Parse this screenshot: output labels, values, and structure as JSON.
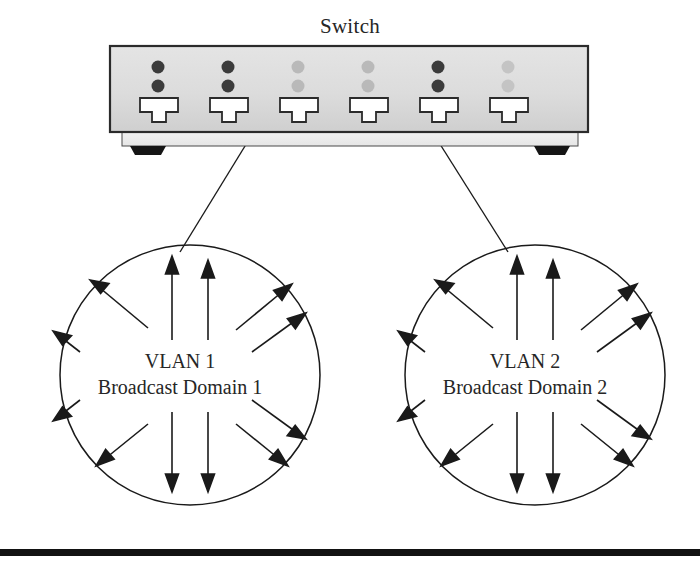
{
  "figure": {
    "title": "Switch",
    "background_color": "#ffffff",
    "line_color": "#1a1a1a"
  },
  "switch_device": {
    "name": "Switch",
    "label": "Switch",
    "body_color": "#dcdcdc",
    "body_shadow_color": "#c8c8c8",
    "base_color": "#efefef",
    "border_color": "#2b2b2b",
    "foot_color": "#151515",
    "port_count": 6,
    "port_label": "RJ45 port",
    "led_rows": 2,
    "led_active_color": "#3b3b3b",
    "led_inactive_color": "#b9b9b9",
    "ports": [
      {
        "index": 1,
        "led_top": "active",
        "led_bottom": "active"
      },
      {
        "index": 2,
        "led_top": "active",
        "led_bottom": "active"
      },
      {
        "index": 3,
        "led_top": "inactive",
        "led_bottom": "inactive"
      },
      {
        "index": 4,
        "led_top": "inactive",
        "led_bottom": "inactive"
      },
      {
        "index": 5,
        "led_top": "active",
        "led_bottom": "active"
      },
      {
        "index": 6,
        "led_top": "inactive",
        "led_bottom": "inactive"
      }
    ]
  },
  "domains": [
    {
      "id": "vlan1",
      "line1": "VLAN 1",
      "line2": "Broadcast Domain 1",
      "center_x": 190,
      "center_y": 375,
      "radius": 130,
      "arrow_count": 12
    },
    {
      "id": "vlan2",
      "line1": "VLAN 2",
      "line2": "Broadcast Domain 2",
      "center_x": 535,
      "center_y": 375,
      "radius": 130,
      "arrow_count": 12
    }
  ],
  "connectors": [
    {
      "name": "switch-to-vlan1",
      "from_x": 253,
      "from_y": 139,
      "to_x": 180,
      "to_y": 252
    },
    {
      "name": "switch-to-vlan2",
      "from_x": 433,
      "from_y": 139,
      "to_x": 508,
      "to_y": 252
    }
  ],
  "footer_rule": {
    "name": "bottom-rule",
    "color": "#121212",
    "y": 549,
    "height": 7
  }
}
